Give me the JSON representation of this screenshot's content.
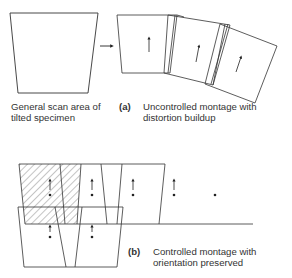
{
  "colors": {
    "line": "#333333",
    "hatch": "#555555",
    "background": "#ffffff"
  },
  "left_panel": {
    "caption_line1": "General scan area of",
    "caption_line2": "tilted specimen"
  },
  "panel_a": {
    "tag": "(a)",
    "caption_line1": "Uncontrolled montage with",
    "caption_line2": "distortion buildup"
  },
  "panel_b": {
    "tag": "(b)",
    "caption_line1": "Controlled montage with",
    "caption_line2": "orientation preserved"
  },
  "icons": {
    "transition_arrow": "right-arrow-icon",
    "orientation_marker": "up-arrow-icon",
    "position_dot": "dot-icon"
  }
}
